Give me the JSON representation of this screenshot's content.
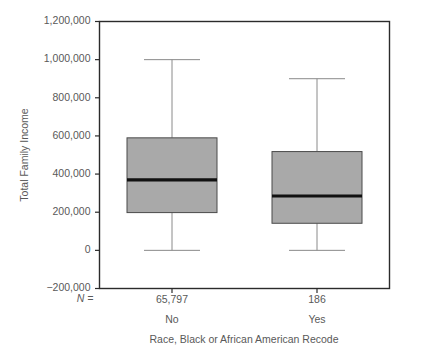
{
  "chart_data": {
    "type": "box",
    "title": "",
    "xlabel": "Race, Black or African American Recode",
    "ylabel": "Total Family Income",
    "ylim": [
      -200000,
      1200000
    ],
    "grid": false,
    "legend": "none",
    "y_ticks": [
      {
        "value": 1200000,
        "label": "1,200,000"
      },
      {
        "value": 1000000,
        "label": "1,000,000"
      },
      {
        "value": 800000,
        "label": "800,000"
      },
      {
        "value": 600000,
        "label": "600,000"
      },
      {
        "value": 400000,
        "label": "400,000"
      },
      {
        "value": 200000,
        "label": "200,000"
      },
      {
        "value": 0,
        "label": "0"
      },
      {
        "value": -200000,
        "label": "−200,000"
      }
    ],
    "n_prefix": "N =",
    "categories": [
      "No",
      "Yes"
    ],
    "counts": [
      "65,797",
      "186"
    ],
    "boxes": [
      {
        "category": "No",
        "count": "65,797",
        "whisker_low": 0,
        "q1": 198000,
        "median": 370000,
        "q3": 590000,
        "whisker_high": 1000000
      },
      {
        "category": "Yes",
        "count": "186",
        "whisker_low": 0,
        "q1": 142000,
        "median": 285000,
        "q3": 518000,
        "whisker_high": 900000
      }
    ],
    "colors": {
      "box_fill": "#a9a9a9",
      "box_stroke": "#4a4a4a",
      "median": "#111111",
      "whisker": "#8a8a8a",
      "axis": "#2b2b2b",
      "text": "#595959",
      "background": "#ffffff"
    }
  }
}
